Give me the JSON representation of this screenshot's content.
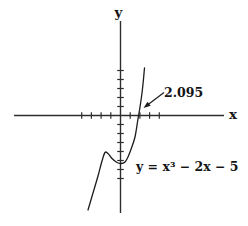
{
  "figure": {
    "background": "#ffffff",
    "ink": "#1c1c1c"
  },
  "chart_data": {
    "type": "line",
    "title": "",
    "equation": "y = x³ − 2x − 5",
    "root_annotation": {
      "label": "2.095",
      "x": 2.095,
      "y": 0
    },
    "x_axis": {
      "label": "x",
      "tick_interval": 1,
      "ticks": [
        -4,
        -3,
        -2,
        -1,
        1,
        2,
        3,
        4
      ]
    },
    "y_axis": {
      "label": "y",
      "tick_interval": 1,
      "ticks": [
        5,
        4,
        3,
        2,
        1,
        -1,
        -2,
        -3,
        -4,
        -5,
        -6,
        -7
      ]
    },
    "series": [
      {
        "name": "y = x³ − 2x − 5",
        "points": [
          {
            "x": -2,
            "y": -9
          },
          {
            "x": -1,
            "y": -4
          },
          {
            "x": 0,
            "y": -5
          },
          {
            "x": 1,
            "y": -6
          },
          {
            "x": 2,
            "y": -1
          },
          {
            "x": 2.095,
            "y": 0
          }
        ]
      }
    ],
    "legend": "none",
    "grid": "off",
    "layout": {
      "width": 248,
      "height": 226,
      "origin_px": [
        120.5,
        115.5
      ],
      "unit_px": [
        9.7,
        9.0
      ],
      "x_axis_px": {
        "x1": 14,
        "x2": 224
      },
      "y_axis_px": {
        "y1": 21,
        "y2": 213
      },
      "tick_half_len": 3.3,
      "curve_px": [
        [
          88,
          210
        ],
        [
          93,
          193
        ],
        [
          98,
          176
        ],
        [
          102,
          161
        ],
        [
          105,
          152.5
        ],
        [
          108,
          153.5
        ],
        [
          112,
          158.5
        ],
        [
          117,
          162.5
        ],
        [
          121,
          163.5
        ],
        [
          125,
          162
        ],
        [
          128,
          157
        ],
        [
          131.5,
          148
        ],
        [
          135,
          137
        ],
        [
          137.5,
          122
        ],
        [
          140,
          107
        ],
        [
          142,
          93
        ],
        [
          143.5,
          79
        ],
        [
          144.5,
          68
        ]
      ],
      "arrow_px": {
        "from": [
          164,
          92.5
        ],
        "to": [
          143.5,
          108
        ]
      },
      "labels_px": {
        "y_axis_label": {
          "x": 118.5,
          "y": 17,
          "anchor": "middle",
          "size": 13.5
        },
        "x_axis_label": {
          "x": 229,
          "y": 119,
          "anchor": "start",
          "size": 13.5
        },
        "root_label": {
          "x": 164,
          "y": 97,
          "anchor": "start",
          "size": 12.5
        },
        "equation": {
          "x": 136,
          "y": 170.5,
          "anchor": "start",
          "size": 12.5
        }
      }
    }
  }
}
